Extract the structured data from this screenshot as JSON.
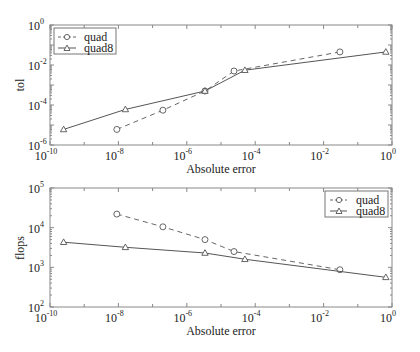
{
  "chart_data": [
    {
      "type": "line",
      "title": "",
      "xlabel": "Absolute error",
      "ylabel": "tol",
      "xscale": "log",
      "yscale": "log",
      "xlim": [
        1e-10,
        1
      ],
      "ylim": [
        1e-06,
        1
      ],
      "x_ticks": [
        "10^-10",
        "10^-8",
        "10^-6",
        "10^-4",
        "10^-2",
        "10^0"
      ],
      "y_ticks": [
        "10^-6",
        "10^-4",
        "10^-2",
        "10^0"
      ],
      "grid": false,
      "legend_position": "upper left",
      "series": [
        {
          "name": "quad",
          "style": "dashed",
          "marker": "circle",
          "x": [
            9e-09,
            2e-07,
            3.4e-06,
            2.4e-05,
            0.03
          ],
          "y": [
            6e-06,
            5.5e-05,
            0.0005,
            0.005,
            0.045
          ]
        },
        {
          "name": "quad8",
          "style": "solid",
          "marker": "triangle",
          "x": [
            2.5e-10,
            1.6e-08,
            3.4e-06,
            5e-05,
            0.66
          ],
          "y": [
            6e-06,
            6e-05,
            0.0005,
            0.0055,
            0.045
          ]
        }
      ]
    },
    {
      "type": "line",
      "title": "",
      "xlabel": "Absolute error",
      "ylabel": "flops",
      "xscale": "log",
      "yscale": "log",
      "xlim": [
        1e-10,
        1
      ],
      "ylim": [
        100,
        100000
      ],
      "x_ticks": [
        "10^-10",
        "10^-8",
        "10^-6",
        "10^-4",
        "10^-2",
        "10^0"
      ],
      "y_ticks": [
        "10^2",
        "10^3",
        "10^4",
        "10^5"
      ],
      "grid": false,
      "legend_position": "upper right",
      "series": [
        {
          "name": "quad",
          "style": "dashed",
          "marker": "circle",
          "x": [
            9e-09,
            2e-07,
            3.4e-06,
            2.4e-05,
            0.03
          ],
          "y": [
            22000,
            10500,
            5000,
            2500,
            870
          ]
        },
        {
          "name": "quad8",
          "style": "solid",
          "marker": "triangle",
          "x": [
            2.5e-10,
            1.6e-08,
            3.4e-06,
            5e-05,
            0.66
          ],
          "y": [
            4300,
            3200,
            2300,
            1600,
            560
          ]
        }
      ]
    }
  ],
  "labels": {
    "top_ylabel": "tol",
    "bottom_ylabel": "flops",
    "xlabel": "Absolute error",
    "legend_quad": "quad",
    "legend_quad8": "quad8",
    "x_tick_base": "10",
    "x_tick_exps": [
      "-10",
      "-8",
      "-6",
      "-4",
      "-2",
      "0"
    ],
    "top_y_tick_exps": [
      "0",
      "-2",
      "-4",
      "-6"
    ],
    "bottom_y_tick_exps": [
      "5",
      "4",
      "3",
      "2"
    ]
  }
}
